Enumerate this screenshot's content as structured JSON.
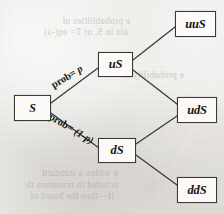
{
  "diagram": {
    "type": "binomial-tree",
    "nodes": [
      {
        "id": "root",
        "label": "S",
        "column": 0,
        "row": 1
      },
      {
        "id": "u",
        "label": "uS",
        "column": 1,
        "row": 0
      },
      {
        "id": "d",
        "label": "dS",
        "column": 1,
        "row": 2
      },
      {
        "id": "uu",
        "label": "uuS",
        "column": 2,
        "row": 0
      },
      {
        "id": "ud",
        "label": "udS",
        "column": 2,
        "row": 1
      },
      {
        "id": "dd",
        "label": "ddS",
        "column": 2,
        "row": 2
      }
    ],
    "edges": [
      {
        "from": "root",
        "to": "u",
        "label": "prob= p",
        "probability": "p"
      },
      {
        "from": "root",
        "to": "d",
        "label": "prob= (1-p)",
        "probability": "(1-p)"
      },
      {
        "from": "u",
        "to": "uu",
        "label": "",
        "probability": ""
      },
      {
        "from": "u",
        "to": "ud",
        "label": "",
        "probability": ""
      },
      {
        "from": "d",
        "to": "ud",
        "label": "",
        "probability": ""
      },
      {
        "from": "d",
        "to": "dd",
        "label": "",
        "probability": ""
      }
    ],
    "edge_labels": {
      "up_prefix": "prob= ",
      "up_value": "p",
      "down_prefix": "prob= ",
      "down_value": "(1-p)"
    },
    "colors": {
      "node_border": "#3b3936",
      "node_fill": "#fbfaf8",
      "edge_line": "#3a3835",
      "text": "#17160f",
      "paper": "#eceae6"
    }
  },
  "showthrough": {
    "lines": [
      {
        "text": "e probabilities of",
        "left": 62,
        "top": 16
      },
      {
        "text": "ain in S, or T= eq(-s)",
        "left": 44,
        "top": 27
      },
      {
        "text": "e probability of",
        "left": 122,
        "top": 70
      },
      {
        "text": "e within a standard",
        "left": 42,
        "top": 168
      },
      {
        "text": "ncluded in reventure th",
        "left": 26,
        "top": 180
      },
      {
        "text": "if—then the board of",
        "left": 30,
        "top": 191
      }
    ]
  }
}
